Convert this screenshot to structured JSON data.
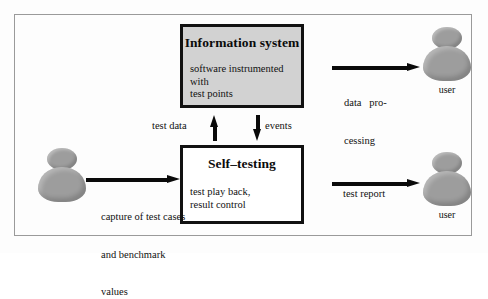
{
  "diagram": {
    "frame": {
      "name": "outer-frame"
    },
    "boxes": [
      {
        "id": "information-system",
        "title": "Information system",
        "body_lines": [
          "software instrumented with",
          "test points"
        ],
        "fill": "#d2d2d2",
        "border": "#111111"
      },
      {
        "id": "self-testing",
        "title": "Self–testing",
        "body_lines": [
          "test play back,",
          "result control"
        ],
        "fill": "#ffffff",
        "border": "#111111"
      }
    ],
    "actors": [
      {
        "id": "tester",
        "caption": ""
      },
      {
        "id": "user-top",
        "caption": "user"
      },
      {
        "id": "user-bottom",
        "caption": "user"
      }
    ],
    "flows": [
      {
        "id": "capture",
        "label_lines": [
          "capture of test cases",
          "and benchmark",
          "values"
        ],
        "direction": "right"
      },
      {
        "id": "test-data",
        "label": "test data",
        "direction": "up"
      },
      {
        "id": "events",
        "label": "events",
        "direction": "down"
      },
      {
        "id": "data-processing",
        "label_lines": [
          "data   pro-",
          "cessing"
        ],
        "direction": "right"
      },
      {
        "id": "test-report",
        "label": "test report",
        "direction": "right"
      }
    ],
    "colors": {
      "actor_gray": "#9d9d9d",
      "box_shaded": "#d2d2d2",
      "stroke": "#0a0a0a",
      "frame": "#9a9a9a"
    }
  }
}
